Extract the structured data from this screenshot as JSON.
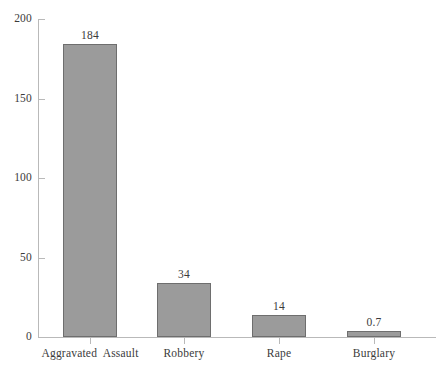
{
  "chart_data": {
    "type": "bar",
    "title": "",
    "subtitle": "",
    "xlabel": "",
    "ylabel": "",
    "categories": [
      "Aggravated  Assault",
      "Robbery",
      "Rape",
      "Burglary"
    ],
    "values": [
      184,
      34,
      14,
      0.7
    ],
    "value_labels": [
      "184",
      "34",
      "14",
      "0.7"
    ],
    "ylim": [
      0,
      200
    ],
    "yticks": [
      0,
      50,
      100,
      150,
      200
    ],
    "ytick_labels": [
      "0",
      "50",
      "100",
      "150",
      "200"
    ],
    "grid": false,
    "legend": null,
    "legend_position": "none",
    "series": [
      {
        "name": "",
        "values": [
          184,
          34,
          14,
          0.7
        ]
      }
    ],
    "colors": {
      "bar_fill": "#9b9b9b",
      "bar_stroke": "#6e6e6e",
      "axis": "#b9b9b9",
      "text": "#3b3b3b",
      "background": "#ffffff"
    }
  }
}
